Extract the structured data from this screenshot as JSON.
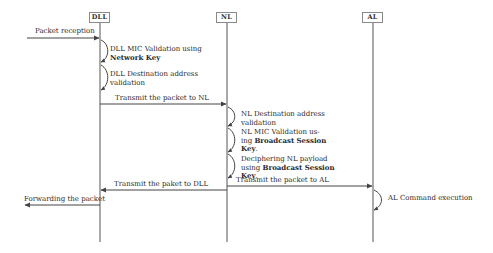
{
  "diagram": {
    "type": "sequence",
    "participants": [
      {
        "id": "dll",
        "label": "DLL",
        "x": 100
      },
      {
        "id": "nl",
        "label": "NL",
        "x": 227
      },
      {
        "id": "al",
        "label": "AL",
        "x": 373
      }
    ],
    "messages": [
      {
        "from": "external-left",
        "to": "DLL",
        "label": "Packet reception"
      },
      {
        "from": "DLL",
        "to": "NL",
        "label": "Transmit the packet to NL"
      },
      {
        "from": "NL",
        "to": "AL",
        "label": "Transmit the packet to AL"
      },
      {
        "from": "NL",
        "to": "DLL",
        "label": "Transmit the paket to DLL"
      },
      {
        "from": "DLL",
        "to": "external-left",
        "label": "Forwarding the packet"
      }
    ],
    "self_actions": {
      "dll_1": {
        "text": "DLL MIC Validation using",
        "bold": "Network Key"
      },
      "dll_2": {
        "line1": "DLL Destination address",
        "line2": "validation"
      },
      "nl_1": {
        "line1": "NL Destination address",
        "line2": "validation"
      },
      "nl_2": {
        "line1": "NL MIC Validation us-",
        "line2_pre": "ing ",
        "line2_bold": "Broadcast Session",
        "line3_bold": "Key",
        "line3_post": "."
      },
      "nl_3": {
        "line1": "Deciphering NL payload",
        "line2_pre": "using ",
        "line2_bold": "Broadcast Session",
        "line3_bold": "Key",
        "line3_post": "."
      },
      "al_1": {
        "text": "AL Command execution"
      }
    }
  },
  "colors": {
    "line": "#555555",
    "box_border": "#8a8a8a",
    "text": "#2a2a2a",
    "background": "#ffffff"
  }
}
